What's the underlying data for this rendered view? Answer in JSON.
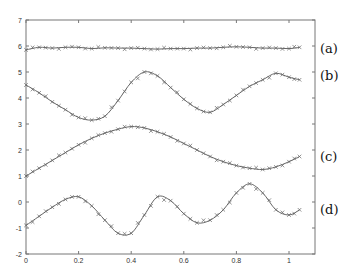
{
  "chart_data": {
    "type": "line",
    "title": "",
    "xlabel": "",
    "ylabel": "",
    "xlim": [
      0,
      1.1
    ],
    "ylim": [
      -2,
      7
    ],
    "grid": false,
    "legend_position": "right (inline labels)",
    "x_ticks": [
      0,
      0.2,
      0.4,
      0.6,
      0.8,
      1
    ],
    "x_tick_labels": [
      "0",
      "0.2",
      "0.4",
      "0.6",
      "0.8",
      "1"
    ],
    "y_ticks": [
      -2,
      -1,
      0,
      1,
      2,
      3,
      4,
      5,
      6,
      7
    ],
    "y_tick_labels": [
      "-2",
      "-1",
      "0",
      "1",
      "2",
      "3",
      "4",
      "5",
      "6",
      "7"
    ],
    "marker": "x",
    "x": [
      0.0,
      0.05,
      0.1,
      0.15,
      0.2,
      0.25,
      0.3,
      0.35,
      0.4,
      0.45,
      0.5,
      0.55,
      0.6,
      0.65,
      0.7,
      0.75,
      0.8,
      0.85,
      0.9,
      0.95,
      1.0,
      1.04
    ],
    "series": [
      {
        "name": "(a)",
        "label": "(a)",
        "values": [
          5.85,
          5.95,
          5.92,
          5.95,
          5.95,
          5.9,
          5.93,
          5.92,
          5.92,
          5.9,
          5.88,
          5.9,
          5.9,
          5.92,
          5.92,
          5.95,
          5.97,
          5.95,
          5.92,
          5.92,
          5.9,
          5.95
        ]
      },
      {
        "name": "(b)",
        "label": "(b)",
        "values": [
          4.5,
          4.2,
          3.85,
          3.55,
          3.25,
          3.15,
          3.3,
          3.9,
          4.6,
          5.0,
          4.85,
          4.4,
          3.95,
          3.6,
          3.45,
          3.75,
          4.1,
          4.45,
          4.7,
          4.95,
          4.8,
          4.7
        ]
      },
      {
        "name": "(c)",
        "label": "(c)",
        "values": [
          1.0,
          1.3,
          1.6,
          1.9,
          2.2,
          2.45,
          2.65,
          2.8,
          2.9,
          2.85,
          2.7,
          2.5,
          2.25,
          2.0,
          1.75,
          1.55,
          1.4,
          1.3,
          1.25,
          1.35,
          1.55,
          1.75
        ]
      },
      {
        "name": "(d)",
        "label": "(d)",
        "values": [
          -0.9,
          -0.55,
          -0.2,
          0.1,
          0.2,
          -0.15,
          -0.7,
          -1.2,
          -1.2,
          -0.5,
          0.2,
          0.05,
          -0.45,
          -0.8,
          -0.7,
          -0.3,
          0.35,
          0.7,
          0.35,
          -0.3,
          -0.5,
          -0.3
        ]
      }
    ]
  },
  "labels": {
    "a": "(a)",
    "b": "(b)",
    "c": "(c)",
    "d": "(d)"
  },
  "colors": {
    "line": "#555555",
    "marker": "#666666",
    "axis": "#777777",
    "text": "#111111"
  }
}
